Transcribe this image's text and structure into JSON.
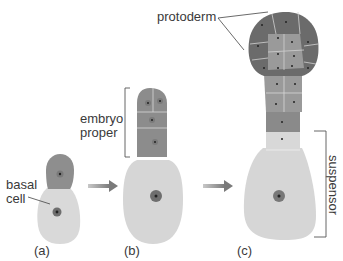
{
  "figure": {
    "labels": {
      "protoderm": "protoderm",
      "embryo_proper_line1": "embryo",
      "embryo_proper_line2": "proper",
      "basal_cell_line1": "basal",
      "basal_cell_line2": "cell",
      "suspensor": "suspensor"
    },
    "panels": [
      {
        "id": "a",
        "caption": "(a)"
      },
      {
        "id": "b",
        "caption": "(b)"
      },
      {
        "id": "c",
        "caption": "(c)"
      }
    ],
    "colors": {
      "protoderm_cell": "#6b6b6b",
      "inner_cell": "#9a9a9a",
      "embryo_cell": "#8c8c8c",
      "suspensor_cell": "#d6d6d6",
      "nucleus": "#6e6e6e",
      "arrow": "#8a8a8a",
      "text": "#3a3a3a"
    }
  }
}
